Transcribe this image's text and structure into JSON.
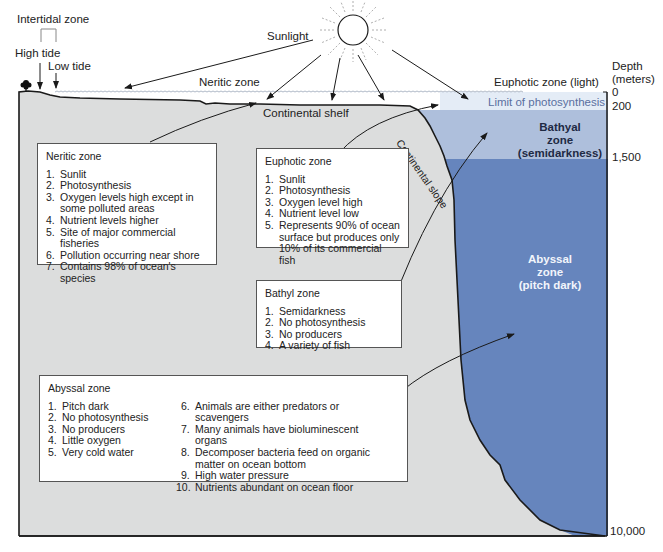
{
  "labels": {
    "intertidal_zone": "Intertidal zone",
    "high_tide": "High tide",
    "low_tide": "Low tide",
    "sunlight": "Sunlight",
    "neritic_zone": "Neritic zone",
    "euphotic_zone_light": "Euphotic zone (light)",
    "limit_of_photosynthesis": "Limit of photosynthesis",
    "continental_shelf": "Continental shelf",
    "continental_slope": "Continental slope",
    "bathyal_zone": [
      "Bathyal",
      "zone",
      "(semidarkness)"
    ],
    "abyssal_zone": [
      "Abyssal",
      "zone",
      "(pitch dark)"
    ]
  },
  "depth_axis": {
    "title": [
      "Depth",
      "(meters)"
    ],
    "ticks": [
      "0",
      "200",
      "1,500",
      "10,000"
    ]
  },
  "boxes": {
    "neritic": {
      "title": "Neritic zone",
      "items": [
        {
          "n": "1.",
          "text": "Sunlit"
        },
        {
          "n": "2.",
          "text": "Photosynthesis"
        },
        {
          "n": "3.",
          "text": "Oxygen levels high except in some polluted areas"
        },
        {
          "n": "4.",
          "text": "Nutrient levels higher"
        },
        {
          "n": "5.",
          "text": "Site of major commercial fisheries"
        },
        {
          "n": "6.",
          "text": "Pollution occurring near shore"
        },
        {
          "n": "7.",
          "text": "Contains 98% of ocean's species"
        }
      ]
    },
    "euphotic": {
      "title": "Euphotic zone",
      "items": [
        {
          "n": "1.",
          "text": "Sunlit"
        },
        {
          "n": "2.",
          "text": "Photosynthesis"
        },
        {
          "n": "3.",
          "text": "Oxygen level high"
        },
        {
          "n": "4.",
          "text": "Nutrient level low"
        },
        {
          "n": "5.",
          "text": "Represents 90% of ocean surface but produces only 10% of its commercial fish"
        }
      ]
    },
    "bathyl": {
      "title": "Bathyl zone",
      "items": [
        {
          "n": "1.",
          "text": "Semidarkness"
        },
        {
          "n": "2.",
          "text": "No photosynthesis"
        },
        {
          "n": "3.",
          "text": "No producers"
        },
        {
          "n": "4.",
          "text": "A variety of fish"
        }
      ]
    },
    "abyssal": {
      "title": "Abyssal zone",
      "items": [
        {
          "n": "1.",
          "text": "Pitch dark"
        },
        {
          "n": "2.",
          "text": "No photosynthesis"
        },
        {
          "n": "3.",
          "text": "No producers"
        },
        {
          "n": "4.",
          "text": "Little oxygen"
        },
        {
          "n": "5.",
          "text": "Very cold water"
        },
        {
          "n": "6.",
          "text": "Animals are either predators or scavengers"
        },
        {
          "n": "7.",
          "text": "Many animals have bioluminescent organs"
        },
        {
          "n": "8.",
          "text": "Decomposer bacteria feed on organic matter on ocean bottom"
        },
        {
          "n": "9.",
          "text": "High water pressure"
        },
        {
          "n": "10.",
          "text": "Nutrients abundant on ocean floor"
        }
      ]
    }
  },
  "colors": {
    "seafloor": "#dcdddd",
    "euphotic_water": "#e4ecf6",
    "bathyal_water": "#aebfdc",
    "abyssal_water": "#6685bd",
    "outline": "#1a1a1a",
    "limit_text": "#5a6fa0"
  }
}
